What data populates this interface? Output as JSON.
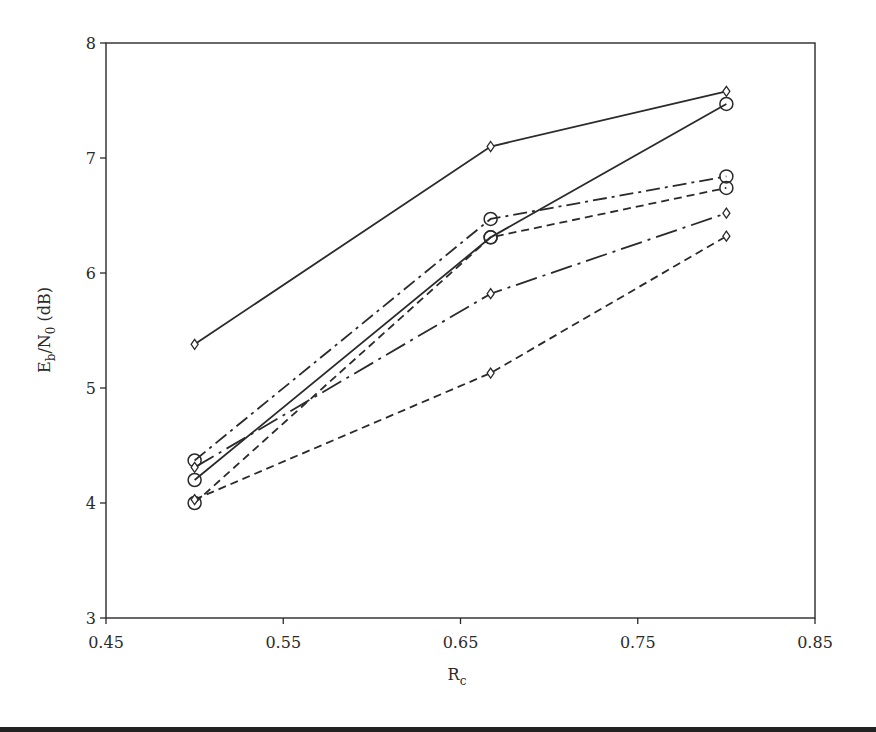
{
  "chart_data": {
    "type": "line",
    "title": "",
    "xlabel": "R",
    "xlabel_subscript": "c",
    "ylabel": "E_b/N_0 (dB)",
    "ylabel_parts": {
      "E": "E",
      "b": "b",
      "slash": "/N",
      "zero": "0",
      "unit": " (dB)"
    },
    "xlim": [
      0.45,
      0.85
    ],
    "ylim": [
      3,
      8
    ],
    "xticks": [
      "0.45",
      "0.55",
      "0.65",
      "0.75",
      "0.85"
    ],
    "yticks": [
      "3",
      "4",
      "5",
      "6",
      "7",
      "8"
    ],
    "grid": false,
    "legend": null,
    "x": [
      0.5,
      0.667,
      0.8
    ],
    "series": [
      {
        "name": "solid-diamond",
        "line": "solid",
        "marker": "diamond",
        "values": [
          5.38,
          7.1,
          7.58
        ]
      },
      {
        "name": "solid-circle",
        "line": "solid",
        "marker": "circle",
        "values": [
          4.2,
          6.31,
          7.47
        ]
      },
      {
        "name": "dashdot-circle",
        "line": "dashdot",
        "marker": "circle",
        "values": [
          4.37,
          6.47,
          6.84
        ]
      },
      {
        "name": "dashed-circle",
        "line": "dashed",
        "marker": "circle",
        "values": [
          4.0,
          6.31,
          6.74
        ]
      },
      {
        "name": "longdashdot-diamond",
        "line": "longdashdot",
        "marker": "diamond",
        "values": [
          4.31,
          5.82,
          6.52
        ]
      },
      {
        "name": "dashed-diamond",
        "line": "dashed",
        "marker": "diamond",
        "values": [
          4.03,
          5.13,
          6.32
        ]
      }
    ]
  },
  "colors": {
    "ink": "#2a2a2a",
    "background": "#ffffff"
  }
}
